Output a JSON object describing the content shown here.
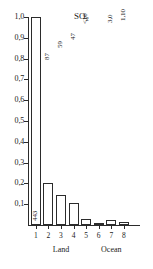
{
  "chart_data": {
    "type": "bar",
    "title": "SO2",
    "title_main": "SO",
    "title_sub": "2",
    "xlabel": "",
    "ylabel": "",
    "ylim": [
      0,
      1.0
    ],
    "grid": false,
    "legend": false,
    "categories": [
      "1",
      "2",
      "3",
      "4",
      "5",
      "6",
      "7",
      "8"
    ],
    "values": [
      1.0,
      0.203,
      0.142,
      0.104,
      0.028,
      0.004,
      0.022,
      0.013
    ],
    "point_labels": [
      "443",
      "87",
      "59",
      "47",
      "<10",
      "",
      "3,0",
      "1,10"
    ],
    "ytick_labels": [
      "0,1",
      "0,2",
      "0,3",
      "0,4",
      "0,5",
      "0,6",
      "0,7",
      "0,8",
      "0,9",
      "1,0"
    ],
    "ytick_values": [
      0.1,
      0.2,
      0.3,
      0.4,
      0.5,
      0.6,
      0.7,
      0.8,
      0.9,
      1.0
    ],
    "groups": [
      {
        "label": "Land",
        "from": 1,
        "to": 5
      },
      {
        "label": "Ocean",
        "from": 6,
        "to": 8
      }
    ],
    "colors": {
      "bar_fill": "#ffffff",
      "bar_stroke": "#2b2b2b",
      "axis": "#2b2b2b",
      "text": "#1a1a1a",
      "background": "#ffffff"
    }
  }
}
